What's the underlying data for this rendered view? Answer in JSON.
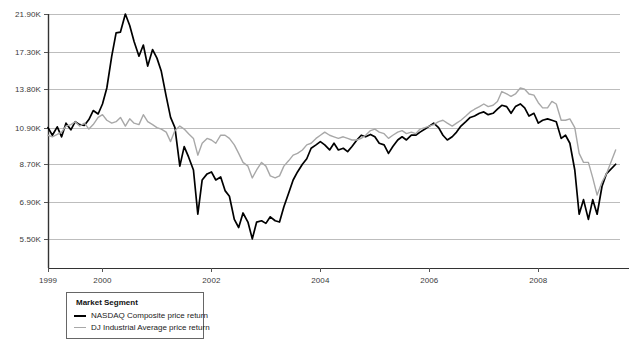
{
  "legend": {
    "title": "Market Segment",
    "entries": [
      {
        "label": "NASDAQ Composite price return",
        "color": "#000000",
        "key": "nasdaq"
      },
      {
        "label": "DJ Industrial Average price return",
        "color": "#a8a8a8",
        "key": "dj"
      }
    ]
  },
  "chart_data": {
    "type": "line",
    "title": "",
    "subtitle": "",
    "xlabel": "",
    "ylabel": "",
    "grid": true,
    "legend_position": "bottom-left",
    "yscale": "log",
    "ytick_labels": [
      "21.90K",
      "17.30K",
      "13.80K",
      "10.90K",
      "8.70K",
      "6.90K",
      "5.50K"
    ],
    "ytick_values": [
      21900,
      17300,
      13800,
      10900,
      8700,
      6900,
      5500
    ],
    "ylim": [
      4600,
      21900
    ],
    "xtick_labels": [
      "1999",
      "2000",
      "2002",
      "2004",
      "2006",
      "2008"
    ],
    "xtick_values": [
      1999,
      2000,
      2002,
      2004,
      2006,
      2008
    ],
    "xlim": [
      1999.0,
      2009.5
    ],
    "series": [
      {
        "name": "NASDAQ Composite price return",
        "color": "#000000",
        "x": [
          1999.0,
          1999.08,
          1999.17,
          1999.25,
          1999.33,
          1999.42,
          1999.5,
          1999.58,
          1999.67,
          1999.75,
          1999.83,
          1999.92,
          2000.0,
          2000.08,
          2000.17,
          2000.25,
          2000.33,
          2000.42,
          2000.5,
          2000.58,
          2000.67,
          2000.75,
          2000.83,
          2000.92,
          2001.0,
          2001.08,
          2001.17,
          2001.25,
          2001.33,
          2001.42,
          2001.5,
          2001.58,
          2001.67,
          2001.75,
          2001.83,
          2001.92,
          2002.0,
          2002.08,
          2002.17,
          2002.25,
          2002.33,
          2002.42,
          2002.5,
          2002.58,
          2002.67,
          2002.75,
          2002.83,
          2002.92,
          2003.0,
          2003.08,
          2003.17,
          2003.25,
          2003.33,
          2003.42,
          2003.5,
          2003.58,
          2003.67,
          2003.75,
          2003.83,
          2003.92,
          2004.0,
          2004.08,
          2004.17,
          2004.25,
          2004.33,
          2004.42,
          2004.5,
          2004.58,
          2004.67,
          2004.75,
          2004.83,
          2004.92,
          2005.0,
          2005.08,
          2005.17,
          2005.25,
          2005.33,
          2005.42,
          2005.5,
          2005.58,
          2005.67,
          2005.75,
          2005.83,
          2005.92,
          2006.0,
          2006.08,
          2006.17,
          2006.25,
          2006.33,
          2006.42,
          2006.5,
          2006.58,
          2006.67,
          2006.75,
          2006.83,
          2006.92,
          2007.0,
          2007.08,
          2007.17,
          2007.25,
          2007.33,
          2007.42,
          2007.5,
          2007.58,
          2007.67,
          2007.75,
          2007.83,
          2007.92,
          2008.0,
          2008.08,
          2008.17,
          2008.25,
          2008.33,
          2008.42,
          2008.5,
          2008.58,
          2008.67,
          2008.75,
          2008.83,
          2008.92,
          2009.0,
          2009.08,
          2009.17,
          2009.25,
          2009.42
        ],
        "values": [
          10900,
          10400,
          10950,
          10300,
          11200,
          10750,
          11300,
          11100,
          11050,
          11450,
          12100,
          11850,
          12600,
          13900,
          16900,
          19500,
          19600,
          21900,
          20400,
          18500,
          16900,
          18100,
          15900,
          17600,
          16700,
          15400,
          13200,
          11600,
          10900,
          8600,
          9700,
          9100,
          8400,
          6400,
          7900,
          8200,
          8300,
          7900,
          8050,
          7400,
          7150,
          6200,
          5900,
          6450,
          6100,
          5500,
          6100,
          6150,
          6050,
          6300,
          6150,
          6100,
          6700,
          7300,
          7900,
          8300,
          8700,
          9000,
          9600,
          9800,
          10000,
          9800,
          9500,
          9900,
          9500,
          9600,
          9400,
          9700,
          10100,
          10400,
          10300,
          10450,
          10300,
          9900,
          9800,
          9300,
          9700,
          10100,
          10300,
          10100,
          10400,
          10400,
          10600,
          10800,
          11000,
          11200,
          10900,
          10400,
          10100,
          10300,
          10600,
          11000,
          11300,
          11600,
          11700,
          11900,
          12000,
          11800,
          11900,
          12200,
          12500,
          12400,
          11900,
          12400,
          12600,
          12300,
          11700,
          11900,
          11200,
          11400,
          11500,
          11400,
          11300,
          10200,
          10400,
          9900,
          8400,
          6400,
          7000,
          6200,
          7000,
          6400,
          7600,
          8200,
          8700
        ]
      },
      {
        "name": "DJ Industrial Average price return",
        "color": "#a8a8a8",
        "x": [
          1999.0,
          1999.08,
          1999.17,
          1999.25,
          1999.33,
          1999.42,
          1999.5,
          1999.58,
          1999.67,
          1999.75,
          1999.83,
          1999.92,
          2000.0,
          2000.08,
          2000.17,
          2000.25,
          2000.33,
          2000.42,
          2000.5,
          2000.58,
          2000.67,
          2000.75,
          2000.83,
          2000.92,
          2001.0,
          2001.08,
          2001.17,
          2001.25,
          2001.33,
          2001.42,
          2001.5,
          2001.58,
          2001.67,
          2001.75,
          2001.83,
          2001.92,
          2002.0,
          2002.08,
          2002.17,
          2002.25,
          2002.33,
          2002.42,
          2002.5,
          2002.58,
          2002.67,
          2002.75,
          2002.83,
          2002.92,
          2003.0,
          2003.08,
          2003.17,
          2003.25,
          2003.33,
          2003.42,
          2003.5,
          2003.58,
          2003.67,
          2003.75,
          2003.83,
          2003.92,
          2004.0,
          2004.08,
          2004.17,
          2004.25,
          2004.33,
          2004.42,
          2004.5,
          2004.58,
          2004.67,
          2004.75,
          2004.83,
          2004.92,
          2005.0,
          2005.08,
          2005.17,
          2005.25,
          2005.33,
          2005.42,
          2005.5,
          2005.58,
          2005.67,
          2005.75,
          2005.83,
          2005.92,
          2006.0,
          2006.08,
          2006.17,
          2006.25,
          2006.33,
          2006.42,
          2006.5,
          2006.58,
          2006.67,
          2006.75,
          2006.83,
          2006.92,
          2007.0,
          2007.08,
          2007.17,
          2007.25,
          2007.33,
          2007.42,
          2007.5,
          2007.58,
          2007.67,
          2007.75,
          2007.83,
          2007.92,
          2008.0,
          2008.08,
          2008.17,
          2008.25,
          2008.33,
          2008.42,
          2008.5,
          2008.58,
          2008.67,
          2008.75,
          2008.83,
          2008.92,
          2009.0,
          2009.08,
          2009.17,
          2009.25,
          2009.42
        ],
        "values": [
          10400,
          10300,
          10450,
          10600,
          11000,
          11100,
          11300,
          11000,
          11200,
          10800,
          11100,
          11600,
          11800,
          11400,
          11200,
          11300,
          11600,
          11000,
          11500,
          11200,
          11100,
          11800,
          11300,
          11100,
          10900,
          10800,
          10600,
          10000,
          10700,
          11000,
          10800,
          10500,
          10200,
          9200,
          9900,
          10200,
          10100,
          9900,
          10400,
          10400,
          10200,
          9800,
          9300,
          8800,
          8600,
          8000,
          8400,
          8800,
          8600,
          8100,
          8000,
          8100,
          8600,
          8900,
          9200,
          9300,
          9500,
          9800,
          9900,
          10200,
          10400,
          10600,
          10400,
          10300,
          10200,
          10300,
          10200,
          10100,
          10100,
          10200,
          10400,
          10700,
          10800,
          10600,
          10500,
          10200,
          10400,
          10600,
          10700,
          10500,
          10600,
          10500,
          10800,
          10900,
          11000,
          11100,
          11300,
          11400,
          11200,
          11000,
          11200,
          11400,
          11700,
          12000,
          12200,
          12400,
          12600,
          12400,
          12500,
          12800,
          13600,
          13400,
          13200,
          13400,
          13900,
          13800,
          13400,
          13300,
          12700,
          12300,
          12300,
          12800,
          12600,
          11400,
          11400,
          11500,
          10900,
          9300,
          8800,
          8800,
          8000,
          7200,
          7800,
          8200,
          9500
        ]
      }
    ]
  }
}
